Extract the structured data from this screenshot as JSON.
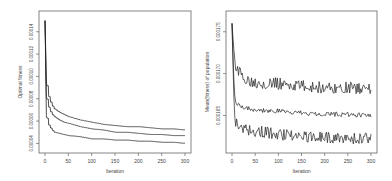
{
  "chart_data": [
    {
      "type": "line",
      "title": "",
      "xlabel": "Iteration",
      "ylabel": "Optimal fitness",
      "xlim": [
        0,
        300
      ],
      "ylim": [
        3.5e-05,
        0.000155
      ],
      "grid": false,
      "legend": null,
      "xticks": [
        "0",
        "50",
        "100",
        "150",
        "200",
        "250",
        "300"
      ],
      "yticks": [
        "0.00004",
        "0.00006",
        "0.00008",
        "0.00010",
        "0.00012",
        "0.00014"
      ],
      "x": [
        0,
        3,
        6,
        10,
        15,
        20,
        30,
        40,
        50,
        75,
        100,
        125,
        150,
        175,
        200,
        225,
        250,
        275,
        300
      ],
      "series": [
        {
          "name": "upper",
          "values": [
            0.00015,
            9.5e-05,
            8.5e-05,
            7.9e-05,
            7.4e-05,
            7.1e-05,
            6.8e-05,
            6.6e-05,
            6.4e-05,
            6.1e-05,
            5.9e-05,
            5.7e-05,
            5.6e-05,
            5.5e-05,
            5.5e-05,
            5.4e-05,
            5.3e-05,
            5.3e-05,
            5.2e-05
          ]
        },
        {
          "name": "mean",
          "values": [
            0.00015,
            8.2e-05,
            7.5e-05,
            7e-05,
            6.6e-05,
            6.4e-05,
            6.1e-05,
            5.9e-05,
            5.8e-05,
            5.5e-05,
            5.3e-05,
            5.2e-05,
            5e-05,
            5e-05,
            4.9e-05,
            4.8e-05,
            4.8e-05,
            4.7e-05,
            4.7e-05
          ]
        },
        {
          "name": "lower",
          "values": [
            0.00015,
            6.5e-05,
            5.8e-05,
            5.5e-05,
            5.2e-05,
            5e-05,
            4.9e-05,
            4.8e-05,
            4.7e-05,
            4.6e-05,
            4.4e-05,
            4.4e-05,
            4.3e-05,
            4.3e-05,
            4.2e-05,
            4.2e-05,
            4.1e-05,
            4.1e-05,
            4e-05
          ]
        }
      ]
    },
    {
      "type": "line",
      "title": "",
      "xlabel": "Iteration",
      "ylabel": "Mean(fitness) of population",
      "xlim": [
        0,
        300
      ],
      "ylim": [
        0.000161,
        0.000177
      ],
      "grid": false,
      "legend": null,
      "xticks": [
        "0",
        "50",
        "100",
        "150",
        "200",
        "250",
        "300"
      ],
      "yticks": [
        "0.000165",
        "0.000170",
        "0.000175"
      ],
      "x": [
        0,
        5,
        10,
        25,
        50,
        100,
        150,
        200,
        250,
        300
      ],
      "series": [
        {
          "name": "upper",
          "values": [
            0.000176,
            0.000172,
            0.0001705,
            0.0001695,
            0.000169,
            0.0001688,
            0.0001685,
            0.0001683,
            0.0001683,
            0.0001682
          ]
        },
        {
          "name": "mean",
          "values": [
            0.000176,
            0.0001675,
            0.0001665,
            0.000166,
            0.0001657,
            0.0001655,
            0.0001653,
            0.0001652,
            0.0001651,
            0.000165
          ]
        },
        {
          "name": "lower",
          "values": [
            0.000176,
            0.000165,
            0.000164,
            0.0001635,
            0.0001632,
            0.0001628,
            0.0001625,
            0.0001624,
            0.0001623,
            0.0001622
          ]
        }
      ]
    }
  ]
}
